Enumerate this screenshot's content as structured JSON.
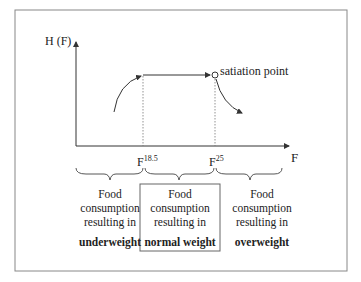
{
  "axes": {
    "y_label": "H (F)",
    "x_label": "F"
  },
  "ticks": [
    {
      "base": "F",
      "sup": "18.5"
    },
    {
      "base": "F",
      "sup": "25"
    }
  ],
  "annotation": "satiation point",
  "columns": [
    {
      "line1": "Food",
      "line2": "consumption",
      "line3": "resulting in",
      "bold": "underweight"
    },
    {
      "line1": "Food",
      "line2": "consumption",
      "line3": "resulting in",
      "bold": "normal weight"
    },
    {
      "line1": "Food",
      "line2": "consumption",
      "line3": "resulting in",
      "bold": "overweight"
    }
  ],
  "colors": {
    "line": "#333333",
    "frame": "#888888"
  }
}
